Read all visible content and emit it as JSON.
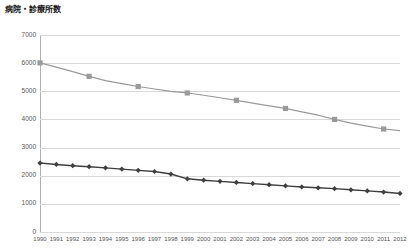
{
  "chart_data": {
    "type": "line",
    "title": "病院・診療所数",
    "xlabel": "",
    "ylabel": "",
    "ylim": [
      0,
      7000
    ],
    "ytick_step": 1000,
    "yticks": [
      0,
      1000,
      2000,
      3000,
      4000,
      5000,
      6000,
      7000
    ],
    "grid": true,
    "legend": "none",
    "categories": [
      "1990",
      "1991",
      "1992",
      "1993",
      "1994",
      "1995",
      "1996",
      "1997",
      "1998",
      "1999",
      "2000",
      "2001",
      "2002",
      "2003",
      "2004",
      "2005",
      "2006",
      "2007",
      "2008",
      "2009",
      "2010",
      "2011",
      "2012"
    ],
    "series": [
      {
        "name": "診療所数",
        "color": "#9a9a9a",
        "marker": "square",
        "marker_years": [
          "1990",
          "1993",
          "1996",
          "1999",
          "2002",
          "2005",
          "2008",
          "2011"
        ],
        "values": [
          6010,
          5860,
          5700,
          5530,
          5380,
          5270,
          5170,
          5080,
          5000,
          4940,
          4860,
          4770,
          4680,
          4580,
          4480,
          4390,
          4270,
          4150,
          4000,
          3870,
          3760,
          3660,
          3600
        ]
      },
      {
        "name": "病院数",
        "color": "#3f3f3f",
        "marker": "diamond",
        "marker_years": [
          "1990",
          "1991",
          "1992",
          "1993",
          "1994",
          "1995",
          "1996",
          "1997",
          "1998",
          "1999",
          "2000",
          "2001",
          "2002",
          "2003",
          "2004",
          "2005",
          "2006",
          "2007",
          "2008",
          "2009",
          "2010",
          "2011",
          "2012"
        ],
        "values": [
          2450,
          2400,
          2355,
          2320,
          2280,
          2235,
          2190,
          2150,
          2060,
          1890,
          1840,
          1800,
          1760,
          1720,
          1680,
          1640,
          1600,
          1570,
          1540,
          1500,
          1460,
          1420,
          1370
        ]
      }
    ]
  },
  "axis": {
    "y_labels": [
      "7000",
      "6000",
      "5000",
      "4000",
      "3000",
      "2000",
      "1000",
      "0"
    ]
  }
}
